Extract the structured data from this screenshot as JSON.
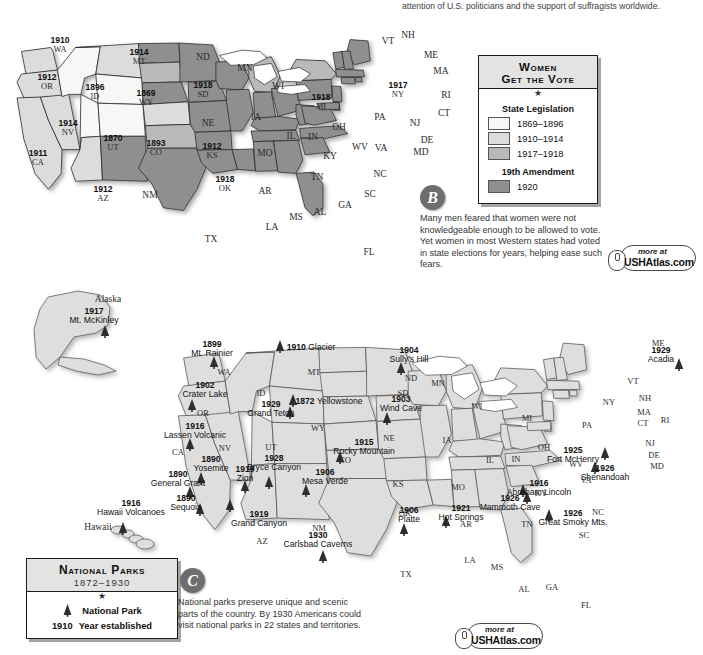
{
  "top_text": "attention of U.S. politicians and the support of suffragists worldwide.",
  "suffrage_map": {
    "legend": {
      "title_line1": "Women",
      "title_line2": "Get the Vote",
      "star": "★",
      "section1": "State Legislation",
      "items": [
        {
          "label": "1869–1896",
          "color": "#f7f7f7"
        },
        {
          "label": "1910–1914",
          "color": "#dcdcdc"
        },
        {
          "label": "1917–1918",
          "color": "#b9b9b9"
        }
      ],
      "section2": "19th Amendment",
      "items2": [
        {
          "label": "1920",
          "color": "#8f8f8f"
        }
      ]
    },
    "badge": "B",
    "caption": "Many men feared that women were not knowledgeable enough to be allowed to vote. Yet women in most Western states had voted in state elections for years, helping ease such fears.",
    "stamp": {
      "more": "more at",
      "url": "USHAtlas.com"
    },
    "states": [
      {
        "abbr": "WA",
        "year": "1910",
        "x": 60,
        "y": 45,
        "fill": "#dcdcdc"
      },
      {
        "abbr": "OR",
        "year": "1912",
        "x": 47,
        "y": 82,
        "fill": "#dcdcdc"
      },
      {
        "abbr": "CA",
        "year": "1911",
        "x": 38,
        "y": 158,
        "fill": "#dcdcdc"
      },
      {
        "abbr": "NV",
        "year": "1914",
        "x": 68,
        "y": 128,
        "fill": "#dcdcdc"
      },
      {
        "abbr": "ID",
        "year": "1896",
        "x": 95,
        "y": 92,
        "fill": "#f7f7f7"
      },
      {
        "abbr": "MT",
        "year": "1914",
        "x": 139,
        "y": 57,
        "fill": "#dcdcdc"
      },
      {
        "abbr": "WY",
        "year": "1869",
        "x": 146,
        "y": 98,
        "fill": "#f7f7f7"
      },
      {
        "abbr": "UT",
        "year": "1870",
        "x": 113,
        "y": 143,
        "fill": "#f7f7f7"
      },
      {
        "abbr": "CO",
        "year": "1893",
        "x": 156,
        "y": 148,
        "fill": "#f7f7f7"
      },
      {
        "abbr": "AZ",
        "year": "1912",
        "x": 103,
        "y": 194,
        "fill": "#dcdcdc"
      },
      {
        "abbr": "NM",
        "year": "",
        "x": 150,
        "y": 196,
        "fill": "#8f8f8f"
      },
      {
        "abbr": "ND",
        "year": "",
        "x": 203,
        "y": 58,
        "fill": "#8f8f8f"
      },
      {
        "abbr": "SD",
        "year": "1918",
        "x": 203,
        "y": 90,
        "fill": "#b9b9b9"
      },
      {
        "abbr": "NE",
        "year": "",
        "x": 208,
        "y": 124,
        "fill": "#8f8f8f"
      },
      {
        "abbr": "KS",
        "year": "1912",
        "x": 212,
        "y": 151,
        "fill": "#dcdcdc"
      },
      {
        "abbr": "OK",
        "year": "1918",
        "x": 225,
        "y": 184,
        "fill": "#b9b9b9"
      },
      {
        "abbr": "TX",
        "year": "",
        "x": 211,
        "y": 240,
        "fill": "#8f8f8f"
      },
      {
        "abbr": "MN",
        "year": "",
        "x": 245,
        "y": 69,
        "fill": "#8f8f8f"
      },
      {
        "abbr": "IA",
        "year": "",
        "x": 256,
        "y": 118,
        "fill": "#8f8f8f"
      },
      {
        "abbr": "MO",
        "year": "",
        "x": 265,
        "y": 154,
        "fill": "#8f8f8f"
      },
      {
        "abbr": "AR",
        "year": "",
        "x": 265,
        "y": 192,
        "fill": "#8f8f8f"
      },
      {
        "abbr": "LA",
        "year": "",
        "x": 272,
        "y": 228,
        "fill": "#8f8f8f"
      },
      {
        "abbr": "WI",
        "year": "",
        "x": 278,
        "y": 87,
        "fill": "#8f8f8f"
      },
      {
        "abbr": "IL",
        "year": "",
        "x": 291,
        "y": 137,
        "fill": "#8f8f8f"
      },
      {
        "abbr": "MS",
        "year": "",
        "x": 296,
        "y": 218,
        "fill": "#8f8f8f"
      },
      {
        "abbr": "MI",
        "year": "1918",
        "x": 321,
        "y": 102,
        "fill": "#b9b9b9"
      },
      {
        "abbr": "IN",
        "year": "",
        "x": 313,
        "y": 138,
        "fill": "#8f8f8f"
      },
      {
        "abbr": "KY",
        "year": "",
        "x": 330,
        "y": 157,
        "fill": "#8f8f8f"
      },
      {
        "abbr": "TN",
        "year": "",
        "x": 317,
        "y": 178,
        "fill": "#8f8f8f"
      },
      {
        "abbr": "AL",
        "year": "",
        "x": 320,
        "y": 213,
        "fill": "#8f8f8f"
      },
      {
        "abbr": "GA",
        "year": "",
        "x": 345,
        "y": 206,
        "fill": "#8f8f8f"
      },
      {
        "abbr": "OH",
        "year": "",
        "x": 339,
        "y": 128,
        "fill": "#8f8f8f"
      },
      {
        "abbr": "WV",
        "year": "",
        "x": 360,
        "y": 148,
        "fill": "#8f8f8f"
      },
      {
        "abbr": "VA",
        "year": "",
        "x": 381,
        "y": 149,
        "fill": "#8f8f8f"
      },
      {
        "abbr": "NC",
        "year": "",
        "x": 380,
        "y": 175,
        "fill": "#8f8f8f"
      },
      {
        "abbr": "SC",
        "year": "",
        "x": 370,
        "y": 195,
        "fill": "#8f8f8f"
      },
      {
        "abbr": "FL",
        "year": "",
        "x": 369,
        "y": 253,
        "fill": "#8f8f8f"
      },
      {
        "abbr": "PA",
        "year": "",
        "x": 380,
        "y": 118,
        "fill": "#8f8f8f"
      },
      {
        "abbr": "NY",
        "year": "1917",
        "x": 398,
        "y": 90,
        "fill": "#b9b9b9"
      },
      {
        "abbr": "ME",
        "year": "",
        "x": 431,
        "y": 56,
        "fill": "#8f8f8f"
      }
    ],
    "pointer_labels": [
      {
        "abbr": "VT",
        "x": 388,
        "y": 42
      },
      {
        "abbr": "NH",
        "x": 408,
        "y": 36
      },
      {
        "abbr": "MA",
        "x": 441,
        "y": 72
      },
      {
        "abbr": "RI",
        "x": 446,
        "y": 96
      },
      {
        "abbr": "CT",
        "x": 444,
        "y": 114
      },
      {
        "abbr": "NJ",
        "x": 415,
        "y": 124
      },
      {
        "abbr": "DE",
        "x": 427,
        "y": 141
      },
      {
        "abbr": "MD",
        "x": 421,
        "y": 153
      }
    ]
  },
  "parks_map": {
    "legend": {
      "title": "National Parks",
      "subtitle": "1872–1930",
      "star": "★",
      "item_symbol_label": "National Park",
      "year_example": "1910",
      "year_label": "Year established"
    },
    "badge": "C",
    "caption": "National parks preserve unique and scenic parts of the country. By 1930 Americans could visit national parks in 22 states and territories.",
    "stamp": {
      "more": "more at",
      "url": "USHAtlas.com"
    },
    "parks": [
      {
        "name": "Mt. Rainier",
        "year": "1899",
        "x": 212,
        "y": 349,
        "mx": 214,
        "my": 362
      },
      {
        "name": "Glacier",
        "year": "1910",
        "x": 311,
        "y": 345,
        "mx": 280,
        "my": 346,
        "inline": true
      },
      {
        "name": "Sully's Hill",
        "year": "1904",
        "x": 409,
        "y": 355,
        "mx": 401,
        "my": 368
      },
      {
        "name": "Crater Lake",
        "year": "1902",
        "x": 205,
        "y": 390,
        "mx": 192,
        "my": 405
      },
      {
        "name": "Yellowstone",
        "year": "1872",
        "x": 329,
        "y": 399,
        "mx": 293,
        "my": 400,
        "inline": true
      },
      {
        "name": "Grand Teton",
        "year": "1929",
        "x": 271,
        "y": 409,
        "mx": 290,
        "my": 412
      },
      {
        "name": "Wind Cave",
        "year": "1903",
        "x": 401,
        "y": 404,
        "mx": 387,
        "my": 418
      },
      {
        "name": "Lassen Volcanic",
        "year": "1916",
        "x": 195,
        "y": 431,
        "mx": 190,
        "my": 444
      },
      {
        "name": "Rocky Mountain",
        "year": "1915",
        "x": 364,
        "y": 447,
        "mx": 340,
        "my": 457
      },
      {
        "name": "Yosemite",
        "year": "1890",
        "x": 211,
        "y": 464,
        "mx": 201,
        "my": 478
      },
      {
        "name": "Bryce Canyon",
        "year": "1928",
        "x": 274,
        "y": 463,
        "mx": 269,
        "my": 482
      },
      {
        "name": "Zion",
        "year": "1919",
        "x": 245,
        "y": 474,
        "mx": 245,
        "my": 486
      },
      {
        "name": "Mesa Verde",
        "year": "1906",
        "x": 325,
        "y": 477,
        "mx": 306,
        "my": 490
      },
      {
        "name": "General Grant",
        "year": "1890",
        "x": 178,
        "y": 479,
        "mx": 190,
        "my": 492
      },
      {
        "name": "Sequoia",
        "year": "1890",
        "x": 186,
        "y": 503,
        "mx": 200,
        "my": 509
      },
      {
        "name": "Grand Canyon",
        "year": "1919",
        "x": 259,
        "y": 519,
        "mx": 230,
        "my": 505
      },
      {
        "name": "Carlsbad Caverns",
        "year": "1930",
        "x": 318,
        "y": 540,
        "mx": 323,
        "my": 556
      },
      {
        "name": "Platte",
        "year": "1906",
        "x": 409,
        "y": 515,
        "mx": 404,
        "my": 529
      },
      {
        "name": "Hot Springs",
        "year": "1921",
        "x": 461,
        "y": 513,
        "mx": 446,
        "my": 521
      },
      {
        "name": "Mammoth Cave",
        "year": "1926",
        "x": 510,
        "y": 503,
        "mx": 527,
        "my": 497
      },
      {
        "name": "Abraham Lincoln",
        "year": "1916",
        "x": 539,
        "y": 488,
        "mx": 523,
        "my": 490
      },
      {
        "name": "Fort McHenry",
        "year": "1925",
        "x": 573,
        "y": 455,
        "mx": 605,
        "my": 453
      },
      {
        "name": "Shenandoah",
        "year": "1926",
        "x": 605,
        "y": 473,
        "mx": 595,
        "my": 467
      },
      {
        "name": "Great Smoky Mts.",
        "year": "1926",
        "x": 573,
        "y": 518,
        "mx": 549,
        "my": 515
      },
      {
        "name": "Acadia",
        "year": "1929",
        "x": 661,
        "y": 355,
        "mx": 679,
        "my": 364
      },
      {
        "name": "Mt. McKinley",
        "year": "1917",
        "x": 94,
        "y": 316,
        "mx": 105,
        "my": 331
      },
      {
        "name": "Hawaii Volcanoes",
        "year": "1916",
        "x": 131,
        "y": 508,
        "mx": 123,
        "my": 528
      }
    ],
    "region_labels": [
      {
        "abbr": "Alaska",
        "x": 108,
        "y": 300,
        "serif": true
      },
      {
        "abbr": "Hawaii",
        "x": 98,
        "y": 528,
        "serif": true
      },
      {
        "abbr": "WA",
        "x": 224,
        "y": 372
      },
      {
        "abbr": "OR",
        "x": 203,
        "y": 413
      },
      {
        "abbr": "CA",
        "x": 178,
        "y": 452
      },
      {
        "abbr": "NV",
        "x": 225,
        "y": 448
      },
      {
        "abbr": "ID",
        "x": 261,
        "y": 393
      },
      {
        "abbr": "MT",
        "x": 314,
        "y": 372
      },
      {
        "abbr": "WY",
        "x": 318,
        "y": 428
      },
      {
        "abbr": "UT",
        "x": 271,
        "y": 447
      },
      {
        "abbr": "CO",
        "x": 345,
        "y": 460
      },
      {
        "abbr": "AZ",
        "x": 262,
        "y": 541
      },
      {
        "abbr": "NM",
        "x": 319,
        "y": 528
      },
      {
        "abbr": "ND",
        "x": 411,
        "y": 378
      },
      {
        "abbr": "SD",
        "x": 403,
        "y": 393
      },
      {
        "abbr": "NE",
        "x": 389,
        "y": 438
      },
      {
        "abbr": "KS",
        "x": 398,
        "y": 484
      },
      {
        "abbr": "OK",
        "x": 405,
        "y": 513
      },
      {
        "abbr": "TX",
        "x": 406,
        "y": 574
      },
      {
        "abbr": "MN",
        "x": 438,
        "y": 383
      },
      {
        "abbr": "IA",
        "x": 447,
        "y": 440
      },
      {
        "abbr": "MO",
        "x": 458,
        "y": 487
      },
      {
        "abbr": "AR",
        "x": 466,
        "y": 524
      },
      {
        "abbr": "LA",
        "x": 470,
        "y": 560
      },
      {
        "abbr": "WI",
        "x": 477,
        "y": 406
      },
      {
        "abbr": "IL",
        "x": 490,
        "y": 460
      },
      {
        "abbr": "MS",
        "x": 497,
        "y": 567
      },
      {
        "abbr": "MI",
        "x": 527,
        "y": 418
      },
      {
        "abbr": "IN",
        "x": 516,
        "y": 459
      },
      {
        "abbr": "KY",
        "x": 541,
        "y": 493
      },
      {
        "abbr": "TN",
        "x": 527,
        "y": 524
      },
      {
        "abbr": "AL",
        "x": 524,
        "y": 589
      },
      {
        "abbr": "GA",
        "x": 552,
        "y": 587
      },
      {
        "abbr": "OH",
        "x": 544,
        "y": 447
      },
      {
        "abbr": "WV",
        "x": 576,
        "y": 464
      },
      {
        "abbr": "VA",
        "x": 586,
        "y": 480
      },
      {
        "abbr": "NC",
        "x": 598,
        "y": 512
      },
      {
        "abbr": "SC",
        "x": 584,
        "y": 535
      },
      {
        "abbr": "FL",
        "x": 586,
        "y": 605
      },
      {
        "abbr": "PA",
        "x": 587,
        "y": 425
      },
      {
        "abbr": "NY",
        "x": 609,
        "y": 402
      },
      {
        "abbr": "ME",
        "x": 658,
        "y": 343
      },
      {
        "abbr": "VT",
        "x": 633,
        "y": 381
      },
      {
        "abbr": "NH",
        "x": 645,
        "y": 398
      },
      {
        "abbr": "MA",
        "x": 644,
        "y": 412
      },
      {
        "abbr": "CT",
        "x": 643,
        "y": 423
      },
      {
        "abbr": "RI",
        "x": 665,
        "y": 420
      },
      {
        "abbr": "NJ",
        "x": 650,
        "y": 443
      },
      {
        "abbr": "DE",
        "x": 654,
        "y": 455
      },
      {
        "abbr": "MD",
        "x": 657,
        "y": 466
      }
    ]
  }
}
